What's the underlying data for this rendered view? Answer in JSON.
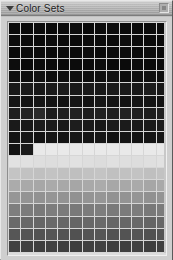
{
  "window": {
    "title": "Color Sets",
    "disclosure_icon": "triangle-down-icon",
    "close_icon": "close-box-icon",
    "chrome_color": "#c0c0c0",
    "titlebar_color": "#a8a8a8"
  },
  "palette": {
    "columns": 13,
    "rows": 21,
    "cell_width_px": 11,
    "cell_height_px": 11,
    "empty_color": "#e9e9e9",
    "grid_line_color": "#d6d6d6",
    "swatch_rows": [
      [
        "#0b0b0b",
        "#0a0a0a",
        "#0c0c0c",
        "#0a0a0a",
        "#0b0b0b",
        "#0d0d0d",
        "#0a0a0a",
        "#0b0b0b",
        "#0c0c0c",
        "#0a0a0a",
        "#0b0b0b",
        "#0c0c0c",
        "#0a0a0a"
      ],
      [
        "#0c0c0c",
        "#0b0b0b",
        "#0a0a0a",
        "#0d0d0d",
        "#0b0b0b",
        "#0a0a0a",
        "#0c0c0c",
        "#0b0b0b",
        "#0a0a0a",
        "#0d0d0d",
        "#0c0c0c",
        "#0b0b0b",
        "#0a0a0a"
      ],
      [
        "#0a0a0a",
        "#0c0c0c",
        "#0b0b0b",
        "#0a0a0a",
        "#0c0c0c",
        "#0b0b0b",
        "#0d0d0d",
        "#0a0a0a",
        "#0b0b0b",
        "#0c0c0c",
        "#0a0a0a",
        "#0d0d0d",
        "#0b0b0b"
      ],
      [
        "#0d0d0d",
        "#0a0a0a",
        "#0c0c0c",
        "#0b0b0b",
        "#0a0a0a",
        "#0c0c0c",
        "#0b0b0b",
        "#0d0d0d",
        "#0a0a0a",
        "#0b0b0b",
        "#0c0c0c",
        "#0a0a0a",
        "#0c0c0c"
      ],
      [
        "#101010",
        "#0e0e0e",
        "#111111",
        "#0d0d0d",
        "#0f0f0f",
        "#101010",
        "#0e0e0e",
        "#0f0f0f",
        "#111111",
        "#0d0d0d",
        "#0f0f0f",
        "#101010",
        "#0e0e0e"
      ],
      [
        "#191919",
        "#1b1b1b",
        "#181818",
        "#1a1a1a",
        "#1c1c1c",
        "#191919",
        "#1a1a1a",
        "#181818",
        "#1b1b1b",
        "#1a1a1a",
        "#191919",
        "#1c1c1c",
        "#181818"
      ],
      [
        "#151515",
        "#131313",
        "#161616",
        "#141414",
        "#121212",
        "#151515",
        "#131313",
        "#161616",
        "#141414",
        "#121212",
        "#151515",
        "#141414",
        "#131313"
      ],
      [
        "#1e1e1e",
        "#222222",
        "#2a2a2a",
        "#1c1c1c",
        "#1f1f1f",
        "#212121",
        "#1d1d1d",
        "#202020",
        "#1e1e1e",
        "#222222",
        "#1f1f1f",
        "#1d1d1d",
        "#202020"
      ],
      [
        "#1a1a1a",
        "#181818",
        "#1c1c1c",
        "#1b1b1b",
        "#191919",
        "#1d1d1d",
        "#1a1a1a",
        "#181818",
        "#1c1c1c",
        "#1b1b1b",
        "#191919",
        "#1a1a1a",
        "#1c1c1c"
      ],
      [
        "#141414",
        "#161616",
        "#121212",
        "#151515",
        "#131313",
        "#171717",
        "#141414",
        "#161616",
        "#121212",
        "#151515",
        "#131313",
        "#141414",
        "#161616"
      ],
      [
        "#131313",
        "#1a1a1a",
        "#e9e9e9",
        "#e9e9e9",
        "#e9e9e9",
        "#e9e9e9",
        "#e9e9e9",
        "#e9e9e9",
        "#e9e9e9",
        "#e9e9e9",
        "#e9e9e9",
        "#e9e9e9",
        "#e9e9e9"
      ],
      [
        "#e2e2e2",
        "#e0e0e0",
        "#dedede",
        "#dddddd",
        "#dfdfdf",
        "#e1e1e1",
        "#dedede",
        "#dcdcdc",
        "#e0e0e0",
        "#dedede",
        "#dddddd",
        "#dfdfdf",
        "#e1e1e1"
      ],
      [
        "#c4c4c4",
        "#c2c2c2",
        "#c0c0c0",
        "#c3c3c3",
        "#c1c1c1",
        "#bfbfbf",
        "#c2c2c2",
        "#c4c4c4",
        "#c0c0c0",
        "#c1c1c1",
        "#c3c3c3",
        "#bfbfbf",
        "#c2c2c2"
      ],
      [
        "#ababab",
        "#a9a9a9",
        "#a7a7a7",
        "#aaaaaa",
        "#a8a8a8",
        "#a6a6a6",
        "#a9a9a9",
        "#ababab",
        "#a7a7a7",
        "#a8a8a8",
        "#aaaaaa",
        "#a6a6a6",
        "#a9a9a9"
      ],
      [
        "#969696",
        "#949494",
        "#929292",
        "#959595",
        "#939393",
        "#919191",
        "#949494",
        "#969696",
        "#929292",
        "#939393",
        "#959595",
        "#919191",
        "#949494"
      ],
      [
        "#7e7e7e",
        "#7c7c7c",
        "#7a7a7a",
        "#7d7d7d",
        "#7b7b7b",
        "#797979",
        "#7c7c7c",
        "#7e7e7e",
        "#7a7a7a",
        "#7b7b7b",
        "#7d7d7d",
        "#797979",
        "#7c7c7c"
      ],
      [
        "#6a6a6a",
        "#686868",
        "#666666",
        "#696969",
        "#676767",
        "#656565",
        "#686868",
        "#6a6a6a",
        "#666666",
        "#676767",
        "#696969",
        "#656565",
        "#686868"
      ],
      [
        "#565656",
        "#545454",
        "#525252",
        "#555555",
        "#535353",
        "#515151",
        "#545454",
        "#565656",
        "#525252",
        "#535353",
        "#555555",
        "#515151",
        "#545454"
      ],
      [
        "#424242",
        "#404040",
        "#3e3e3e",
        "#414141",
        "#3f3f3f",
        "#3d3d3d",
        "#404040",
        "#424242",
        "#3e3e3e",
        "#3f3f3f",
        "#414141",
        "#3d3d3d",
        "#404040"
      ],
      [
        "#2e2e2e",
        "#2c2c2c",
        "#2a2a2a",
        "#2d2d2d",
        "#2b2b2b",
        "#292929",
        "#2c2c2c",
        "#2e2e2e",
        "#2a2a2a",
        "#2b2b2b",
        "#2d2d2d",
        "#292929",
        "#2c2c2c"
      ],
      [
        "#303030",
        "#2c2c2c",
        "#2e2e2e",
        "#2a2a2a",
        "#e9e9e9",
        "#e9e9e9",
        "#e9e9e9",
        "#e9e9e9",
        "#e9e9e9",
        "#e9e9e9",
        "#e9e9e9",
        "#e9e9e9",
        "#e9e9e9"
      ]
    ]
  }
}
